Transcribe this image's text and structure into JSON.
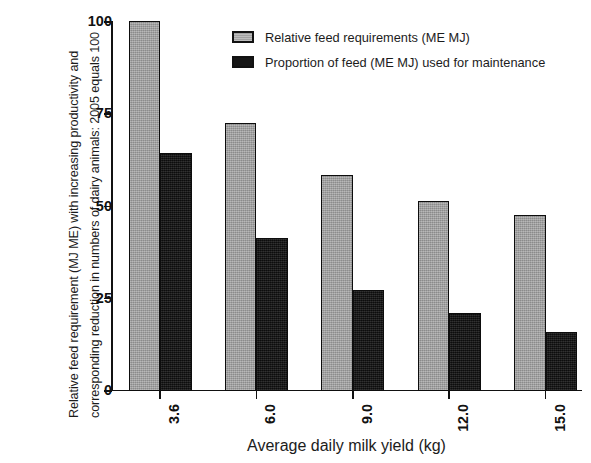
{
  "chart_data": {
    "type": "bar",
    "title": "",
    "xlabel": "Average daily milk yield (kg)",
    "ylabel": "Relative feed requirement (MJ ME) with increasing productivity and corresponding reduction in numbers of dairy animals: 2005 equals 100",
    "categories": [
      "3.6",
      "6.0",
      "9.0",
      "12.0",
      "15.0"
    ],
    "series": [
      {
        "name": "Relative feed requirements (ME MJ)",
        "color": "#9c9c9c",
        "values": [
          100,
          72.4,
          58.3,
          51.2,
          47.4
        ]
      },
      {
        "name": "Proportion of feed (ME MJ) used for maintenance",
        "color": "#151515",
        "values": [
          64.2,
          41.2,
          27.1,
          20.9,
          15.7
        ]
      }
    ],
    "ylim": [
      0,
      100
    ],
    "yticks": [
      "0",
      "25",
      "50",
      "75",
      "100"
    ],
    "ytick_values": [
      0,
      25,
      50,
      75,
      100
    ],
    "grid": false,
    "legend_position": "top-center"
  },
  "legend": {
    "items": [
      {
        "label": "Relative feed requirements (ME MJ)",
        "swatch": "gray"
      },
      {
        "label": "Proportion of feed (ME MJ) used for maintenance",
        "swatch": "black"
      }
    ]
  }
}
